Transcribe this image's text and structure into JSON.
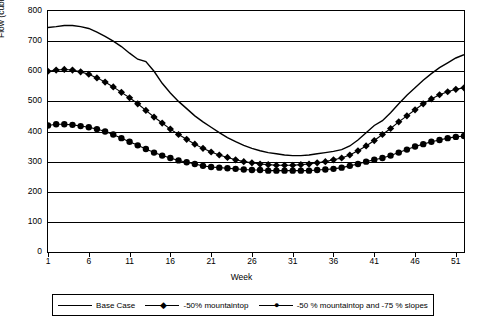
{
  "chart_data": {
    "type": "line",
    "title": "",
    "xlabel": "Week",
    "ylabel": "Flow (cubic metres per day)",
    "xlim": [
      1,
      52
    ],
    "ylim": [
      0,
      800
    ],
    "grid": true,
    "legend_position": "bottom",
    "y_ticks": [
      0,
      100,
      200,
      300,
      400,
      500,
      600,
      700,
      800
    ],
    "x_ticks": [
      1,
      6,
      11,
      16,
      21,
      26,
      31,
      36,
      41,
      46,
      51
    ],
    "x": [
      1,
      2,
      3,
      4,
      5,
      6,
      7,
      8,
      9,
      10,
      11,
      12,
      13,
      14,
      15,
      16,
      17,
      18,
      19,
      20,
      21,
      22,
      23,
      24,
      25,
      26,
      27,
      28,
      29,
      30,
      31,
      32,
      33,
      34,
      35,
      36,
      37,
      38,
      39,
      40,
      41,
      42,
      43,
      44,
      45,
      46,
      47,
      48,
      49,
      50,
      51,
      52
    ],
    "series": [
      {
        "name": "Base  Case",
        "marker": "none",
        "values": [
          745,
          748,
          752,
          752,
          748,
          742,
          730,
          716,
          700,
          682,
          660,
          640,
          632,
          600,
          560,
          528,
          500,
          476,
          452,
          432,
          414,
          396,
          380,
          366,
          354,
          344,
          336,
          330,
          326,
          322,
          320,
          320,
          322,
          326,
          330,
          334,
          340,
          352,
          372,
          396,
          420,
          436,
          462,
          492,
          520,
          545,
          570,
          592,
          612,
          628,
          644,
          655
        ]
      },
      {
        "name": "-50%  mountaintop",
        "marker": "diamond",
        "values": [
          600,
          604,
          606,
          604,
          598,
          590,
          578,
          564,
          548,
          530,
          512,
          492,
          470,
          448,
          428,
          408,
          390,
          374,
          358,
          344,
          332,
          322,
          314,
          306,
          300,
          296,
          292,
          290,
          288,
          288,
          288,
          290,
          292,
          296,
          300,
          306,
          312,
          322,
          336,
          352,
          370,
          390,
          410,
          432,
          452,
          472,
          492,
          508,
          522,
          532,
          540,
          545
        ]
      },
      {
        "name": "-50 % mountaintop and -75 % slopes",
        "marker": "circle",
        "values": [
          420,
          424,
          424,
          422,
          418,
          414,
          408,
          400,
          390,
          378,
          366,
          354,
          342,
          330,
          320,
          312,
          304,
          298,
          292,
          286,
          282,
          280,
          278,
          276,
          274,
          272,
          272,
          270,
          270,
          270,
          270,
          270,
          270,
          272,
          274,
          276,
          280,
          286,
          292,
          300,
          306,
          312,
          320,
          330,
          340,
          350,
          358,
          366,
          372,
          378,
          382,
          385
        ]
      }
    ]
  },
  "legend": {
    "items": [
      {
        "label": "Base  Case",
        "marker": "none"
      },
      {
        "label": "-50%  mountaintop",
        "marker": "diamond"
      },
      {
        "label": "-50 % mountaintop and -75 % slopes",
        "marker": "circle"
      }
    ]
  }
}
